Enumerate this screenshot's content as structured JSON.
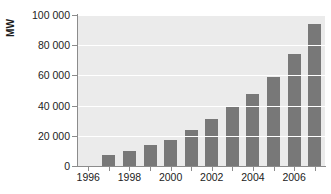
{
  "chart_data": {
    "type": "bar",
    "title": "",
    "xlabel": "",
    "ylabel": "MW",
    "categories": [
      "1996",
      "1997",
      "1998",
      "1999",
      "2000",
      "2001",
      "2002",
      "2003",
      "2004",
      "2005",
      "2006",
      "2007"
    ],
    "values": [
      null,
      7600,
      10200,
      13600,
      17400,
      23900,
      31100,
      39400,
      47600,
      59100,
      74000,
      94000
    ],
    "ylim": [
      0,
      100000
    ],
    "yticks": [
      0,
      20000,
      40000,
      60000,
      80000,
      100000
    ],
    "ytick_labels": [
      "0",
      "20 000",
      "40 000",
      "60 000",
      "80 000",
      "100 000"
    ],
    "xtick_labels": [
      "1996",
      "1998",
      "2000",
      "2002",
      "2004",
      "2006"
    ],
    "grid": true,
    "legend": "none",
    "bar_color": "#787878",
    "plot_background": "#ebebeb",
    "gridline_color": "#ffffff",
    "axis_color": "#8c8c8c"
  },
  "axes": {
    "y_title": "MW"
  }
}
